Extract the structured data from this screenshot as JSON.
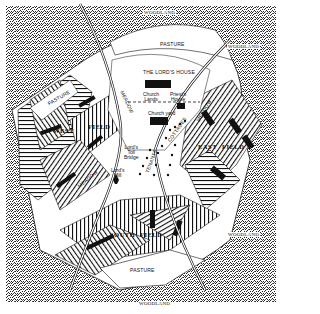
{
  "map": {
    "title": "Medieval Manor",
    "colors": {
      "paper": "#ffffff",
      "ink": "#111111",
      "woodland_stipple": "#333333"
    },
    "regions": {
      "woodland_labels": [
        "WOODLAND",
        "WOODLAND",
        "WOODLAND",
        "WOODLAND"
      ],
      "pasture_labels": [
        "PASTURE",
        "PASTURE",
        "PASTURE"
      ],
      "meadow_labels": [
        "MEADOW",
        "MEADOW",
        "MEADOW"
      ],
      "fields": {
        "west": [
          "WEST",
          "FIELD"
        ],
        "east": [
          "EAST",
          "FIELD"
        ],
        "south": [
          "SOUTH",
          "FIELD"
        ]
      }
    },
    "buildings": {
      "lords_house": "THE LORD'S HOUSE",
      "church_lands": [
        "Church",
        "Lands"
      ],
      "priests_house": [
        "Priest's",
        "House"
      ],
      "church_yard": "Church yard",
      "lords_toll_bridge": [
        "Lord's",
        "Toll",
        "Bridge"
      ],
      "lords_mill": [
        "Lord's",
        "Mill"
      ],
      "cottages": "COTTAGES",
      "tenants": "TENANTS"
    }
  }
}
